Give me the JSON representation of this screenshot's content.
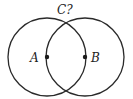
{
  "diagram": {
    "type": "two-circle-construction",
    "stroke_color": "#2a2a2a",
    "background": "#ffffff",
    "circles": [
      {
        "center_label": "A",
        "cx": 47,
        "cy": 57,
        "r": 39
      },
      {
        "center_label": "B",
        "cx": 85,
        "cy": 57,
        "r": 39
      }
    ],
    "points": [
      {
        "label": "A",
        "x": 47,
        "y": 57
      },
      {
        "label": "B",
        "x": 85,
        "y": 57
      }
    ],
    "labels": {
      "a": "A",
      "b": "B",
      "c": "C?"
    }
  }
}
